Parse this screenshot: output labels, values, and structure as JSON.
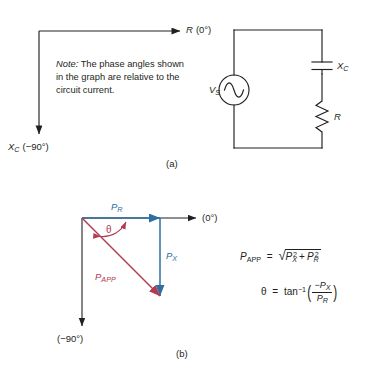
{
  "figure": {
    "panel_a": {
      "caption": "(a)",
      "axis_horizontal_label": "R (0°)",
      "axis_horizontal_symbol": "R",
      "axis_horizontal_angle": "(0°)",
      "axis_vertical_symbol": "X",
      "axis_vertical_subscript": "C",
      "axis_vertical_angle": "(−90°)",
      "note_prefix": "Note:",
      "note_body": " The phase angles shown in the graph are relative to the circuit current."
    },
    "circuit": {
      "source_symbol": "V",
      "source_subscript": "S",
      "capacitor_symbol": "X",
      "capacitor_subscript": "C",
      "resistor_symbol": "R"
    },
    "panel_b": {
      "caption": "(b)",
      "axis_horizontal_angle": "(0°)",
      "axis_vertical_angle": "(−90°)",
      "phasor_pr_symbol": "P",
      "phasor_pr_subscript": "R",
      "phasor_px_symbol": "P",
      "phasor_px_subscript": "X",
      "phasor_papp_symbol": "P",
      "phasor_papp_subscript": "APP",
      "angle_symbol": "θ",
      "color_blue": "#2f6f9f",
      "color_crimson": "#b33a50",
      "formula1": {
        "lhs_symbol": "P",
        "lhs_subscript": "APP",
        "equals": "=",
        "radical": "√",
        "term1_base": "P",
        "term1_sub": "X",
        "term1_sup": "2",
        "plus": "+",
        "term2_base": "P",
        "term2_sub": "R",
        "term2_sup": "2"
      },
      "formula2": {
        "lhs": "θ",
        "equals": "=",
        "func": "tan",
        "func_sup": "−1",
        "num_sign": "−",
        "num_base": "P",
        "num_sub": "X",
        "den_base": "P",
        "den_sub": "R"
      }
    }
  }
}
